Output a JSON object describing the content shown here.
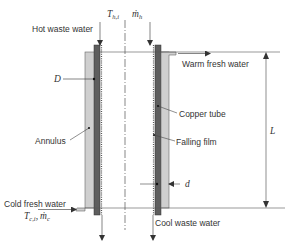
{
  "diagram": {
    "labels": {
      "hot_waste_water": "Hot waste water",
      "warm_fresh_water": "Warm fresh water",
      "copper_tube": "Copper tube",
      "falling_film": "Falling film",
      "annulus": "Annulus",
      "cold_fresh_water": "Cold fresh water",
      "cool_waste_water": "Cool waste water"
    },
    "symbols": {
      "T_hi": "T",
      "T_hi_sub": "h,i",
      "m_h": "ṁ",
      "m_h_sub": "h",
      "D": "D",
      "L": "L",
      "d": "d",
      "T_ci": "T",
      "T_ci_sub": "c,i",
      "m_c": "ṁ",
      "m_c_sub": "c",
      "comma": ","
    },
    "colors": {
      "annulus_fill": "#c8c8c8",
      "copper_fill": "#5a5a5a",
      "line": "#444444",
      "text": "#333333"
    }
  }
}
